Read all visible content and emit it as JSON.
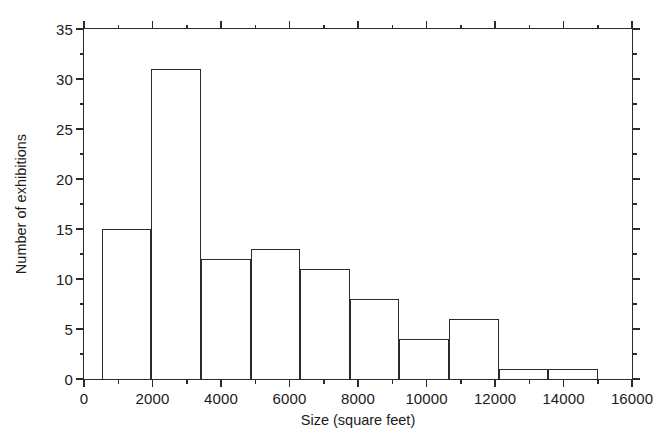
{
  "chart_data": {
    "type": "bar",
    "title": "",
    "subtitle": "",
    "xlabel": "Size (square feet)",
    "ylabel": "Number of exhibitions",
    "xlim": [
      0,
      16000
    ],
    "ylim": [
      0,
      35
    ],
    "grid": false,
    "legend": null,
    "annotations": [],
    "xticks": [
      0,
      2000,
      4000,
      6000,
      8000,
      10000,
      12000,
      14000,
      16000
    ],
    "xticklabels": [
      "0",
      "2000",
      "4000",
      "6000",
      "8000",
      "10000",
      "12000",
      "14000",
      "16000"
    ],
    "xminorticks": [
      1000,
      3000,
      5000,
      7000,
      9000,
      11000,
      13000,
      15000
    ],
    "yticks": [
      0,
      5,
      10,
      15,
      20,
      25,
      30,
      35
    ],
    "yticklabels": [
      "0",
      "5",
      "10",
      "15",
      "20",
      "25",
      "30",
      "35"
    ],
    "yminorticks": [
      2.5,
      7.5,
      12.5,
      17.5,
      22.5,
      27.5,
      32.5
    ],
    "bin_edges": [
      520,
      1968,
      3416,
      4864,
      6312,
      7760,
      9208,
      10656,
      12104,
      13552,
      15000
    ],
    "bin_width": 1448,
    "categories": [
      "520-1968",
      "1968-3416",
      "3416-4864",
      "4864-6312",
      "6312-7760",
      "7760-9208",
      "9208-10656",
      "10656-12104",
      "12104-13552",
      "13552-15000"
    ],
    "values": [
      15,
      31,
      12,
      13,
      11,
      8,
      4,
      6,
      1,
      1
    ],
    "bar_fill": "none",
    "bar_edge_color": "#2b2b2b",
    "axis_color": "#2b2b2b",
    "background_color": "#ffffff"
  }
}
